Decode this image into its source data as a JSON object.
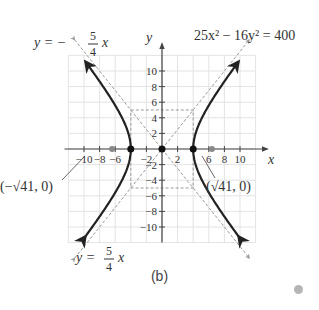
{
  "figure": {
    "caption": "(b)",
    "equation": "25x² − 16y² = 400",
    "axis_x_label": "x",
    "axis_y_label": "y",
    "asymptote_upper_left": {
      "lhs": "y = −",
      "num": "5",
      "den": "4",
      "var": "x"
    },
    "asymptote_lower_left": {
      "lhs": "y =",
      "num": "5",
      "den": "4",
      "var": "x"
    },
    "focus_left_label": "(−√41, 0)",
    "focus_right_label": "(√41, 0)"
  },
  "chart_data": {
    "type": "diagram",
    "curve": "hyperbola",
    "a": 4,
    "b": 5,
    "vertices": [
      [
        -4,
        0
      ],
      [
        4,
        0
      ]
    ],
    "foci": [
      [
        -6.403,
        0
      ],
      [
        6.403,
        0
      ]
    ],
    "center": [
      0,
      0
    ],
    "asymptotes": [
      "y = -5/4 x",
      "y = 5/4 x"
    ],
    "fundamental_rectangle": {
      "x": [
        -4,
        4
      ],
      "y": [
        -5,
        5
      ]
    },
    "x_ticks": [
      -10,
      -8,
      -6,
      -2,
      2,
      6,
      8,
      10
    ],
    "y_ticks": [
      10,
      8,
      6,
      4,
      2,
      -2,
      -4,
      -6,
      -8,
      -10
    ],
    "xlim": [
      -12,
      12
    ],
    "ylim": [
      -12,
      12
    ],
    "grid": true
  },
  "ticks": {
    "x": [
      {
        "v": -10,
        "t": "−10"
      },
      {
        "v": -8,
        "t": "−8"
      },
      {
        "v": -6,
        "t": "−6"
      },
      {
        "v": -2,
        "t": "−2"
      },
      {
        "v": 2,
        "t": "2"
      },
      {
        "v": 6,
        "t": "6"
      },
      {
        "v": 8,
        "t": "8"
      },
      {
        "v": 10,
        "t": "10"
      }
    ],
    "y": [
      {
        "v": 10,
        "t": "10"
      },
      {
        "v": 8,
        "t": "8"
      },
      {
        "v": 6,
        "t": "6"
      },
      {
        "v": 4,
        "t": "4"
      },
      {
        "v": 2,
        "t": "2"
      },
      {
        "v": -2,
        "t": "−2"
      },
      {
        "v": -4,
        "t": "−4"
      },
      {
        "v": -6,
        "t": "−6"
      },
      {
        "v": -8,
        "t": "−8"
      },
      {
        "v": -10,
        "t": "−10"
      }
    ]
  },
  "colors": {
    "curve": "#222222",
    "asymptote": "#999999",
    "grid": "#e3e3e3",
    "axis": "#444444",
    "focus": "#888888"
  }
}
